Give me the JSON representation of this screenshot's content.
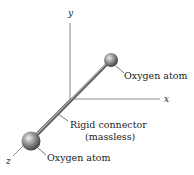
{
  "diagram": {
    "type": "3d-molecule-schematic",
    "axes": {
      "x": "x",
      "y": "y",
      "z": "z"
    },
    "labels": {
      "top_atom": "Oxygen atom",
      "bottom_atom": "Oxygen atom",
      "connector_line1": "Rigid connector",
      "connector_line2": "(massless)"
    },
    "colors": {
      "axis": "#8a8a8a",
      "rod": "#6f6f6f",
      "rod_highlight": "#d9d9d9",
      "atom_dark": "#4a4a4a",
      "atom_light": "#e8e8e8",
      "text": "#222222"
    }
  }
}
